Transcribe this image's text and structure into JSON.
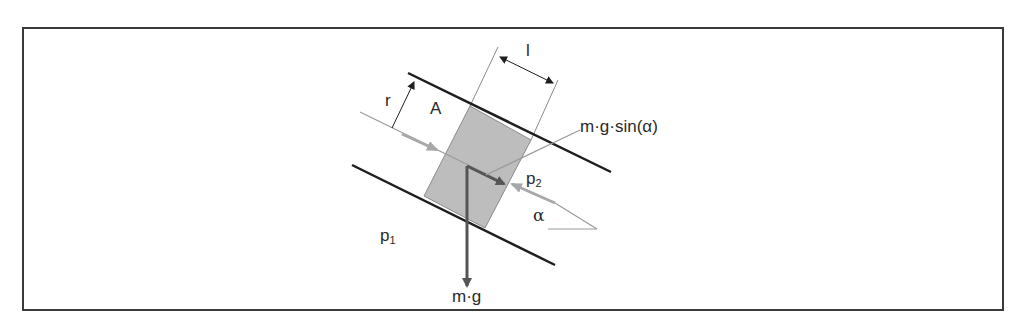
{
  "figure": {
    "labels": {
      "length": "l",
      "radius": "r",
      "area": "A",
      "tangential_force": "m·g·sin(α)",
      "pressure_downstream": "p",
      "pressure_downstream_sub": "2",
      "pressure_upstream": "p",
      "pressure_upstream_sub": "1",
      "angle": "α",
      "weight": "m·g"
    },
    "colors": {
      "frame": "#3a3a3a",
      "pipe_wall": "#1e1e1e",
      "element_fill": "#bdbdbd",
      "element_edge": "#8a8a8a",
      "arrow_dark": "#555555",
      "arrow_light": "#a8a8a8",
      "thin_line": "#9a9a9a"
    }
  }
}
